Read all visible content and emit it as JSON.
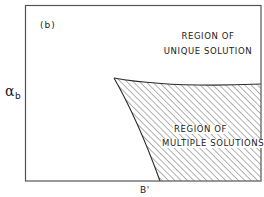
{
  "figure": {
    "panel_label": "(b)",
    "y_axis": {
      "symbol": "α",
      "subscript": "b"
    },
    "x_axis": {
      "label": "B'"
    },
    "regions": [
      {
        "name": "unique",
        "line1": "REGION OF",
        "line2": "UNIQUE SOLUTION",
        "fill": "none"
      },
      {
        "name": "multiple",
        "line1": "REGION OF",
        "line2": "MULTIPLE SOLUTIONS",
        "fill": "diagonal-hatch"
      }
    ],
    "colors": {
      "line": "#2a2a2a",
      "hatch": "#555555",
      "background": "#ffffff"
    }
  }
}
